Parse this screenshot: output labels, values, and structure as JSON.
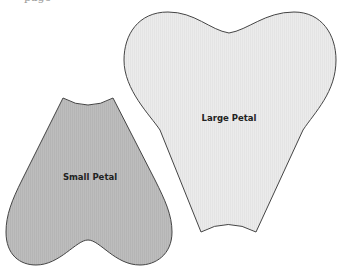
{
  "header": {
    "clipped_text": "page"
  },
  "petals": {
    "large": {
      "label": "Large Petal",
      "fill": "#ebebeb",
      "stroke": "#444444"
    },
    "small": {
      "label": "Small Petal",
      "fill": "#bdbdbd",
      "stroke": "#444444"
    }
  }
}
